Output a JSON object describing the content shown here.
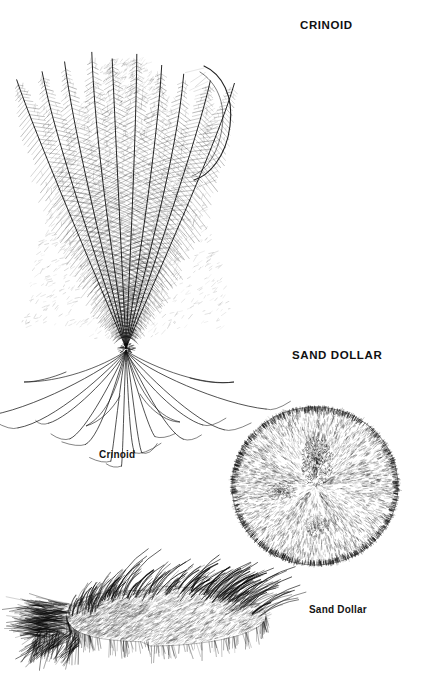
{
  "page": {
    "background_color": "#ffffff",
    "ink_color": "#111111",
    "width": 424,
    "height": 683,
    "style": "pen-and-ink scientific illustration plate"
  },
  "headings": [
    {
      "id": "crinoid",
      "label": "CRINOID"
    },
    {
      "id": "sand-dollar",
      "label": "SAND DOLLAR"
    }
  ],
  "captions": [
    {
      "id": "crinoid",
      "label": "Crinoid"
    },
    {
      "id": "sand-dollar",
      "label": "Sand Dollar"
    }
  ],
  "figures": [
    {
      "id": "crinoid",
      "name": "crinoid-illustration",
      "description": "feather star with plumed arms and radiating cirri",
      "arm_count": 10,
      "cirri_count": 14
    },
    {
      "id": "sand-dollar",
      "name": "sand-dollar-illustration",
      "description": "round flattened test with radiating spine texture and petal pattern",
      "petal_count": 5
    },
    {
      "id": "urchin",
      "name": "spiny-urchin-illustration",
      "description": "oval spine-covered body seen from the side",
      "spine_count": 220
    }
  ]
}
